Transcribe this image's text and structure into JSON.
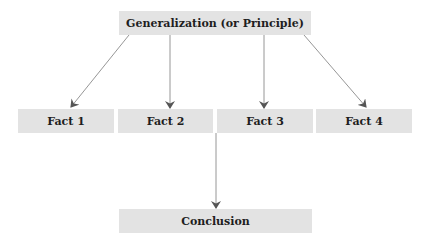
{
  "diagram": {
    "type": "flowchart",
    "colors": {
      "box_fill": "#e3e3e3",
      "text": "#1e1e1e",
      "arrow": "#8a8a8a",
      "arrowhead": "#555555"
    },
    "top": {
      "label": "Generalization (or Principle)"
    },
    "facts": [
      {
        "label": "Fact 1"
      },
      {
        "label": "Fact 2"
      },
      {
        "label": "Fact 3"
      },
      {
        "label": "Fact 4"
      }
    ],
    "bottom": {
      "label": "Conclusion"
    },
    "edges": [
      {
        "from": "Generalization (or Principle)",
        "to": "Fact 1"
      },
      {
        "from": "Generalization (or Principle)",
        "to": "Fact 2"
      },
      {
        "from": "Generalization (or Principle)",
        "to": "Fact 3"
      },
      {
        "from": "Generalization (or Principle)",
        "to": "Fact 4"
      },
      {
        "from": "Facts",
        "to": "Conclusion"
      }
    ]
  }
}
